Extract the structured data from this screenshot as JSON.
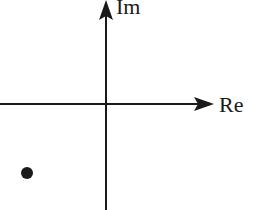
{
  "diagram": {
    "type": "complex-plane",
    "axes": {
      "real_label": "Re",
      "imaginary_label": "Im"
    },
    "points": [
      {
        "quadrant": "third",
        "description": "single point in lower-left quadrant"
      }
    ],
    "colors": {
      "ink": "#1a1a1a",
      "background": "#ffffff"
    }
  }
}
